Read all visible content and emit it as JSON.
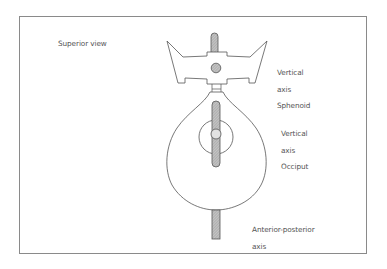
{
  "figure": {
    "view_label": "Superior view",
    "labels": {
      "sphenoid": {
        "line1": "Vertical",
        "line2": "axis",
        "line3": "Sphenoid"
      },
      "occiput": {
        "line1": "Vertical",
        "line2": "axis",
        "line3": "Occiput"
      },
      "ap_axis": {
        "line1": "Anterior-posterior",
        "line2": "axis"
      }
    },
    "colors": {
      "outline": "#555555",
      "axis_fill": "#b5b5b5",
      "pivot_fill": "#dcdcdc",
      "frame": "#8a8a8a",
      "text": "#555555"
    }
  }
}
